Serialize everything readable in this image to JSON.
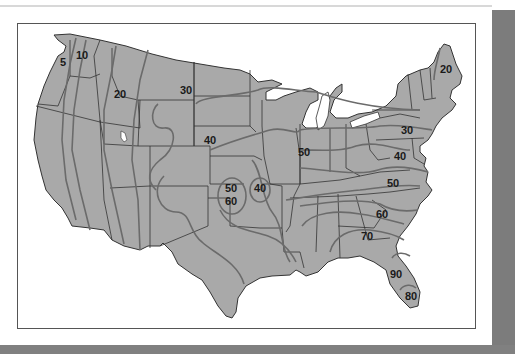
{
  "map": {
    "subject": "United States contour map",
    "colors": {
      "land": "#a9a9a9",
      "state_border": "#333333",
      "contour_line": "#6b6b6b",
      "background": "#ffffff",
      "shadow": "#7c7c7c",
      "label": "#1a1a1a"
    },
    "contour_labels": [
      {
        "id": "wa-5",
        "value": "5",
        "x": 60,
        "y": 66
      },
      {
        "id": "wa-10",
        "value": "10",
        "x": 76,
        "y": 59
      },
      {
        "id": "id-20",
        "value": "20",
        "x": 114,
        "y": 98
      },
      {
        "id": "mt-30",
        "value": "30",
        "x": 180,
        "y": 94
      },
      {
        "id": "ne-40",
        "value": "40",
        "x": 204,
        "y": 144
      },
      {
        "id": "me-20",
        "value": "20",
        "x": 440,
        "y": 73
      },
      {
        "id": "pa-30",
        "value": "30",
        "x": 401,
        "y": 134
      },
      {
        "id": "il-50",
        "value": "50",
        "x": 298,
        "y": 156
      },
      {
        "id": "va-40",
        "value": "40",
        "x": 394,
        "y": 160
      },
      {
        "id": "nc-50",
        "value": "50",
        "x": 387,
        "y": 187
      },
      {
        "id": "ks-50",
        "value": "50",
        "x": 225,
        "y": 192
      },
      {
        "id": "ok-60",
        "value": "60",
        "x": 225,
        "y": 205
      },
      {
        "id": "mo-40",
        "value": "40",
        "x": 254,
        "y": 192
      },
      {
        "id": "sc-60",
        "value": "60",
        "x": 376,
        "y": 218
      },
      {
        "id": "ga-70",
        "value": "70",
        "x": 361,
        "y": 240
      },
      {
        "id": "fl-90",
        "value": "90",
        "x": 390,
        "y": 278
      },
      {
        "id": "fl-80",
        "value": "80",
        "x": 405,
        "y": 300
      }
    ]
  }
}
